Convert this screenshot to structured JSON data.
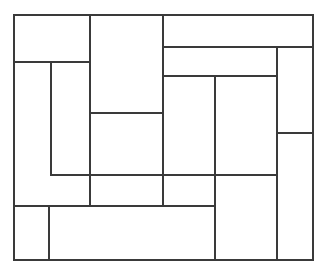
{
  "figure": {
    "kind": "rectangle-dissection-diagram",
    "title": "",
    "caption": "",
    "background_color": "#ffffff",
    "line_color": "#3a3a3a",
    "line_width": 1.6,
    "outer_frame": {
      "x": 14,
      "y": 15,
      "width": 299,
      "height": 245
    },
    "grid_lines": {
      "vertical_x": [
        51,
        90,
        163,
        215,
        277
      ],
      "horizontal_y": [
        47,
        62,
        76,
        113,
        133,
        175,
        206
      ]
    },
    "pieces": [
      {
        "name": "piece-top-left",
        "x": 14,
        "y": 15,
        "width": 76,
        "height": 47,
        "label": ""
      },
      {
        "name": "piece-top-center",
        "x": 90,
        "y": 15,
        "width": 73,
        "height": 98,
        "label": ""
      },
      {
        "name": "piece-top-right-band",
        "x": 163,
        "y": 15,
        "width": 150,
        "height": 32,
        "label": ""
      },
      {
        "name": "piece-left-tall",
        "x": 14,
        "y": 62,
        "width": 37,
        "height": 144,
        "label": ""
      },
      {
        "name": "piece-left-inner-tall",
        "x": 51,
        "y": 62,
        "width": 39,
        "height": 113,
        "label": ""
      },
      {
        "name": "piece-center-lower",
        "x": 90,
        "y": 113,
        "width": 73,
        "height": 62,
        "label": ""
      },
      {
        "name": "piece-right-upper-wide",
        "x": 163,
        "y": 47,
        "width": 114,
        "height": 29,
        "label": ""
      },
      {
        "name": "piece-far-right-upper",
        "x": 277,
        "y": 47,
        "width": 36,
        "height": 86,
        "label": ""
      },
      {
        "name": "piece-mid-right-left-col",
        "x": 163,
        "y": 76,
        "width": 52,
        "height": 99,
        "label": ""
      },
      {
        "name": "piece-mid-right-right-col",
        "x": 215,
        "y": 76,
        "width": 62,
        "height": 99,
        "label": ""
      },
      {
        "name": "piece-far-right-lower",
        "x": 277,
        "y": 133,
        "width": 36,
        "height": 127,
        "label": ""
      },
      {
        "name": "piece-mid-horizontal-band",
        "x": 51,
        "y": 175,
        "width": 164,
        "height": 31,
        "label": ""
      },
      {
        "name": "piece-lower-right-tall",
        "x": 215,
        "y": 175,
        "width": 62,
        "height": 85,
        "label": ""
      },
      {
        "name": "piece-bottom-left-small",
        "x": 14,
        "y": 206,
        "width": 35,
        "height": 54,
        "label": ""
      },
      {
        "name": "piece-bottom-wide",
        "x": 49,
        "y": 206,
        "width": 166,
        "height": 54,
        "label": ""
      }
    ],
    "segments": [
      {
        "name": "outer-top",
        "x1": 14,
        "y1": 15,
        "x2": 313,
        "y2": 15
      },
      {
        "name": "outer-bottom",
        "x1": 14,
        "y1": 260,
        "x2": 313,
        "y2": 260
      },
      {
        "name": "outer-left",
        "x1": 14,
        "y1": 15,
        "x2": 14,
        "y2": 260
      },
      {
        "name": "outer-right",
        "x1": 313,
        "y1": 15,
        "x2": 313,
        "y2": 260
      },
      {
        "name": "h-top-left-below",
        "x1": 14,
        "y1": 62,
        "x2": 90,
        "y2": 62
      },
      {
        "name": "h-top-right-band",
        "x1": 163,
        "y1": 47,
        "x2": 313,
        "y2": 47
      },
      {
        "name": "h-right-upper-wide",
        "x1": 163,
        "y1": 76,
        "x2": 277,
        "y2": 76
      },
      {
        "name": "h-center-split",
        "x1": 90,
        "y1": 113,
        "x2": 163,
        "y2": 113
      },
      {
        "name": "h-far-right-split",
        "x1": 277,
        "y1": 133,
        "x2": 313,
        "y2": 133
      },
      {
        "name": "h-mid-band-top",
        "x1": 51,
        "y1": 175,
        "x2": 277,
        "y2": 175
      },
      {
        "name": "h-bottom-band-top",
        "x1": 14,
        "y1": 206,
        "x2": 215,
        "y2": 206
      },
      {
        "name": "v-left-inner",
        "x1": 51,
        "y1": 62,
        "x2": 51,
        "y2": 175
      },
      {
        "name": "v-bottom-left-small",
        "x1": 49,
        "y1": 206,
        "x2": 49,
        "y2": 260
      },
      {
        "name": "v-center-left",
        "x1": 90,
        "y1": 15,
        "x2": 90,
        "y2": 206
      },
      {
        "name": "v-center-right",
        "x1": 163,
        "y1": 15,
        "x2": 163,
        "y2": 206
      },
      {
        "name": "v-mid-right",
        "x1": 215,
        "y1": 76,
        "x2": 215,
        "y2": 260
      },
      {
        "name": "v-far-right",
        "x1": 277,
        "y1": 47,
        "x2": 277,
        "y2": 260
      }
    ]
  }
}
